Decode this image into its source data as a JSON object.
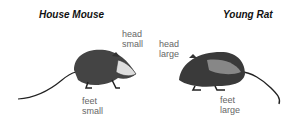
{
  "left": {
    "title": "House Mouse",
    "head_label": [
      "head",
      "small"
    ],
    "feet_label": [
      "feet",
      "small"
    ]
  },
  "right": {
    "title": "Young Rat",
    "head_label": [
      "head",
      "large"
    ],
    "feet_label": [
      "feet",
      "large"
    ]
  }
}
